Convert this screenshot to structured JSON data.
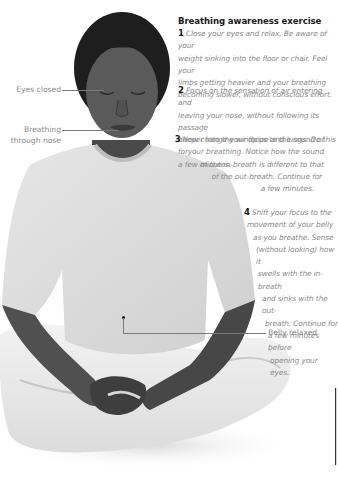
{
  "title": "Breathing awareness exercise",
  "steps": [
    {
      "number": "1",
      "text": "Close your eyes and relax. Be aware of your weight sinking into the floor or chair. Feel your limbs getting heavier and your breathing becoming slower, without conscious effort."
    },
    {
      "number": "2",
      "text": "Focus on the sensation of air entering and leaving your nose, without following its passage deeper into the windpipe and lungs. Do this for a few minutes."
    },
    {
      "number": "3",
      "text": "Now change your focus to the sound of your breathing. Notice how the sound of the in-breath is different to that of the out-breath. Continue for a few minutes."
    },
    {
      "number": "4",
      "text": "Shift your focus to the movement of your belly as you breathe. Sense (without looking) how it swells with the in-breath and sinks with the out-breath. Continue for a few minutes before opening your eyes."
    }
  ],
  "step_lines": {
    "s1": [
      "Close your eyes and relax. Be aware of your",
      "weight sinking into the floor or chair. Feel your",
      "limbs getting heavier and your breathing",
      "becoming slower, without conscious effort."
    ],
    "s2": [
      "Focus on the sensation of air entering and",
      "leaving your nose, without following its passage",
      "deeper into the windpipe and lungs. Do this for",
      "a few minutes."
    ],
    "s3": [
      "Now change your focus to the sound of",
      "your breathing. Notice how the sound",
      "of the in-breath is different to that",
      "of the out-breath. Continue for",
      "a few minutes."
    ],
    "s4": [
      "Shift your focus to the",
      "movement of your belly",
      "as you breathe. Sense",
      "(without looking) how it",
      "swells with the in-breath",
      "and sinks with the out-",
      "breath. Continue for",
      "a few minutes before",
      "opening your eyes."
    ]
  },
  "annotations": {
    "eyes": "Eyes closed",
    "breathing_1": "Breathing",
    "breathing_2": "through nose",
    "belly": "Belly relaxed"
  },
  "colors": {
    "body_text": "#8a8a8a",
    "heading": "#1a1a1a",
    "background": "#ffffff"
  }
}
